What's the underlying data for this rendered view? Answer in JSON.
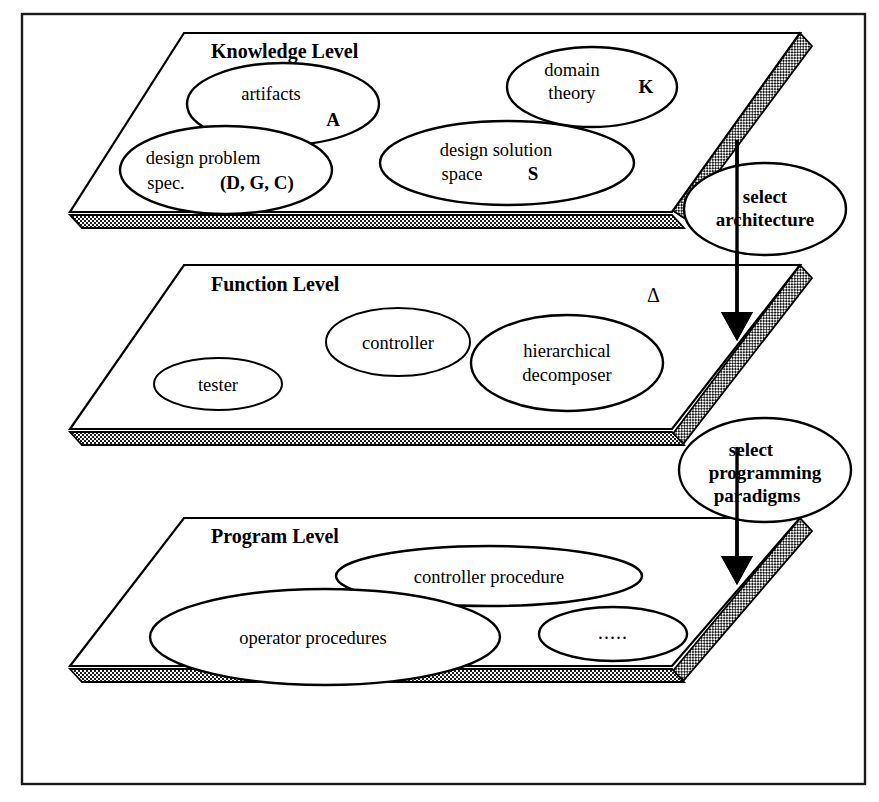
{
  "figure": {
    "frame": {
      "color": "#1a1a1a"
    },
    "colors": {
      "ink": "#000000",
      "paper": "#ffffff",
      "hatch_dark": "#1c1c1c",
      "hatch_light": "#c9c9c9"
    }
  },
  "levels": [
    {
      "id": "knowledge",
      "title": "Knowledge Level",
      "nodes": [
        {
          "id": "artifacts",
          "line1": "artifacts",
          "symbol": "A"
        },
        {
          "id": "domain-theory",
          "line1": "domain",
          "line2": "theory",
          "symbol": "K"
        },
        {
          "id": "design-problem-spec",
          "line1": "design problem",
          "line2": "spec.",
          "symbol": "(D, G, C)"
        },
        {
          "id": "design-solution-space",
          "line1": "design solution",
          "line2": "space",
          "symbol": "S"
        }
      ]
    },
    {
      "id": "function",
      "title": "Function Level",
      "annotation": "Δ",
      "nodes": [
        {
          "id": "tester",
          "line1": "tester"
        },
        {
          "id": "controller",
          "line1": "controller"
        },
        {
          "id": "hierarchical-decomposer",
          "line1": "hierarchical",
          "line2": "decomposer"
        }
      ]
    },
    {
      "id": "program",
      "title": "Program Level",
      "nodes": [
        {
          "id": "controller-procedure",
          "line1": "controller procedure"
        },
        {
          "id": "operator-procedures",
          "line1": "operator procedures"
        },
        {
          "id": "ellipsis",
          "line1": "....."
        }
      ]
    }
  ],
  "transitions": [
    {
      "id": "select-architecture",
      "line1": "select",
      "line2": "architecture",
      "from": "knowledge",
      "to": "function"
    },
    {
      "id": "select-programming-paradigms",
      "line1": "select",
      "line2": "programming",
      "line3": "paradigms",
      "from": "function",
      "to": "program"
    }
  ]
}
